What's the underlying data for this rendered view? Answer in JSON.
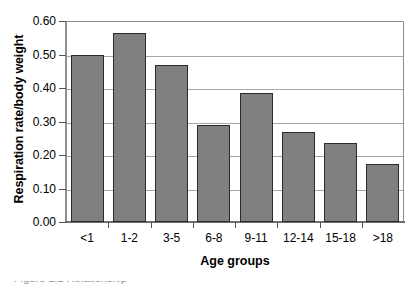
{
  "chart_data": {
    "type": "bar",
    "title": "",
    "xlabel": "Age groups",
    "ylabel": "Respiration rate/body weight",
    "categories": [
      "<1",
      "1-2",
      "3-5",
      "6-8",
      "9-11",
      "12-14",
      "15-18",
      ">18"
    ],
    "values": [
      0.5,
      0.565,
      0.47,
      0.29,
      0.385,
      0.27,
      0.235,
      0.173
    ],
    "ylim": [
      0.0,
      0.6
    ],
    "ytick_step": 0.1,
    "ytick_labels": [
      "0.60",
      "0.50",
      "0.40",
      "0.30",
      "0.20",
      "0.10",
      "0.00"
    ],
    "ytick_values": [
      0.6,
      0.5,
      0.4,
      0.3,
      0.2,
      0.1,
      0.0
    ],
    "grid": "horizontal",
    "legend": "none",
    "bar_color": "#808080",
    "bar_border_color": "#2b2b2b",
    "gridline_color": "#a8a8a8",
    "axis_color": "#6e6e6e"
  },
  "caption": {
    "text": "Figure 1.1  Relationship"
  }
}
